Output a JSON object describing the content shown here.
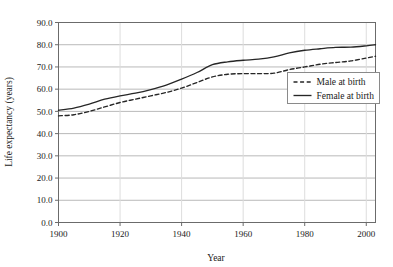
{
  "chart_data": {
    "type": "line",
    "title": "",
    "xlabel": "Year",
    "ylabel": "Life expectancy (years)",
    "xlim": [
      1900,
      2003
    ],
    "ylim": [
      0.0,
      90.0
    ],
    "grid": true,
    "legend_position": "center-right",
    "xticks": [
      1900,
      1920,
      1940,
      1960,
      1980,
      2000
    ],
    "xtick_labels": [
      "1900",
      "1920",
      "1940",
      "1960",
      "1980",
      "2000"
    ],
    "yticks": [
      0.0,
      10.0,
      20.0,
      30.0,
      40.0,
      50.0,
      60.0,
      70.0,
      80.0,
      90.0
    ],
    "ytick_labels": [
      "0.0",
      "10.0",
      "20.0",
      "30.0",
      "40.0",
      "50.0",
      "60.0",
      "70.0",
      "80.0",
      "90.0"
    ],
    "x": [
      1900,
      1905,
      1910,
      1915,
      1920,
      1925,
      1930,
      1935,
      1940,
      1945,
      1950,
      1955,
      1960,
      1965,
      1970,
      1975,
      1980,
      1985,
      1990,
      1995,
      2000,
      2003
    ],
    "series": [
      {
        "name": "Male at birth",
        "style": "dashed",
        "color": "#262626",
        "values": [
          48.0,
          48.5,
          50.0,
          52.0,
          54.0,
          55.5,
          57.0,
          58.5,
          60.5,
          63.0,
          65.5,
          66.7,
          67.0,
          67.0,
          67.2,
          68.8,
          70.0,
          71.2,
          72.0,
          72.7,
          74.0,
          74.8
        ]
      },
      {
        "name": "Female at birth",
        "style": "solid",
        "color": "#262626",
        "values": [
          50.5,
          51.5,
          53.3,
          55.5,
          57.0,
          58.2,
          59.8,
          61.8,
          64.5,
          67.5,
          71.0,
          72.3,
          73.0,
          73.5,
          74.5,
          76.3,
          77.5,
          78.2,
          78.8,
          78.9,
          79.5,
          80.0
        ]
      }
    ],
    "legend_entries": [
      {
        "label": "Male at birth",
        "style": "dashed"
      },
      {
        "label": "Female at birth",
        "style": "solid"
      }
    ],
    "colors": {
      "line": "#262626",
      "gridline": "#b9b9b9",
      "axis": "#6b6b6b",
      "background": "#ffffff",
      "legend_border": "#8a8a8a",
      "text": "#1a1a1a"
    }
  }
}
